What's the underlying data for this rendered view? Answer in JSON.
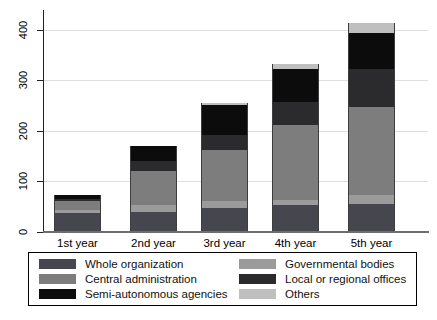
{
  "chart_data": {
    "type": "bar",
    "stacked": true,
    "title": "",
    "xlabel": "",
    "ylabel": "",
    "categories": [
      "1st year",
      "2nd year",
      "3rd year",
      "4th year",
      "5th year"
    ],
    "series": [
      {
        "name": "Whole organization",
        "color": "#46464e",
        "values": [
          38,
          40,
          47,
          54,
          56
        ]
      },
      {
        "name": "Governmental bodies",
        "color": "#9b9b9b",
        "values": [
          6,
          13,
          14,
          9,
          18
        ]
      },
      {
        "name": "Central administration",
        "color": "#7d7d7d",
        "values": [
          18,
          68,
          101,
          148,
          173
        ]
      },
      {
        "name": "Local or regional offices",
        "color": "#2b2b2e",
        "values": [
          4,
          20,
          30,
          46,
          76
        ]
      },
      {
        "name": "Semi-autonomous agencies",
        "color": "#0c0c0c",
        "values": [
          8,
          30,
          59,
          66,
          71
        ]
      },
      {
        "name": "Others",
        "color": "#bfbfbf",
        "values": [
          0,
          0,
          5,
          9,
          19
        ]
      }
    ],
    "y_ticks": [
      0,
      100,
      200,
      300,
      400
    ],
    "ylim": [
      0,
      435
    ],
    "grid": true,
    "legend": {
      "position": "bottom",
      "columns": 2,
      "left_column": [
        "Whole organization",
        "Central administration",
        "Semi-autonomous agencies"
      ],
      "right_column": [
        "Governmental bodies",
        "Local or regional offices",
        "Others"
      ]
    }
  }
}
